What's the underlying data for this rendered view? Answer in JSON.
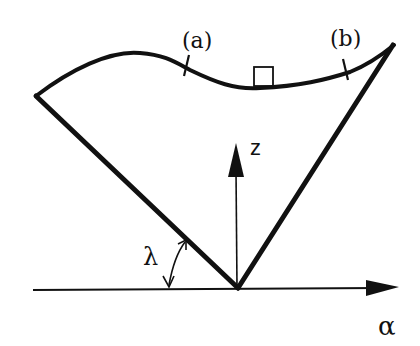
{
  "figure": {
    "labels": {
      "point_a": "(a)",
      "point_b": "(b)",
      "z_axis": "z",
      "alpha_axis": "α",
      "angle": "λ"
    },
    "colors": {
      "ink": "#111111",
      "background": "#ffffff"
    }
  }
}
